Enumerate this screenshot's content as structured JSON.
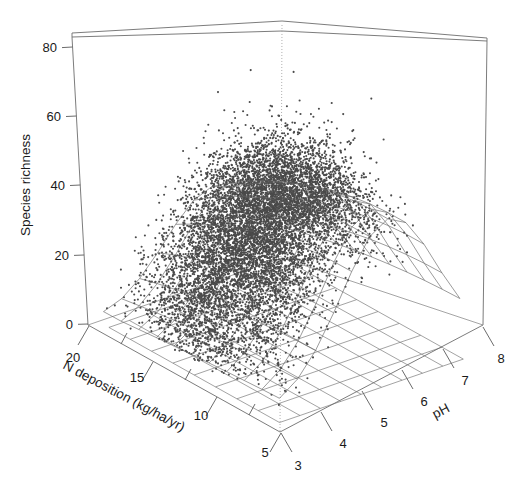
{
  "figure": {
    "type": "3d-scatter-with-surface",
    "background": "#ffffff",
    "point_color": "#4a4a4a",
    "line_color": "#5f5f5f"
  },
  "axes": {
    "z": {
      "name": "Species richness",
      "title": "Species richness",
      "ticks": [
        "0",
        "20",
        "40",
        "60",
        "80"
      ],
      "tick_values": [
        0,
        20,
        40,
        60,
        80
      ],
      "range": [
        -4,
        86
      ],
      "orientation": "vertical-left"
    },
    "x": {
      "name": "N deposition",
      "title": "N deposition (kg/ha/yr)",
      "ticks": [
        "20",
        "15",
        "10",
        "5"
      ],
      "tick_values": [
        20,
        15,
        10,
        5
      ],
      "range": [
        21,
        3
      ],
      "orientation": "bottom-left-receding"
    },
    "y": {
      "name": "pH",
      "title": "pH",
      "ticks": [
        "3",
        "4",
        "5",
        "6",
        "7",
        "8"
      ],
      "tick_values": [
        3,
        4,
        5,
        6,
        7,
        8
      ],
      "range": [
        2.7,
        8.4
      ],
      "orientation": "bottom-right-receding"
    }
  },
  "chart_data": {
    "type": "scatter",
    "title": "",
    "xlabel": "N deposition (kg/ha/yr)",
    "ylabel": "pH",
    "zlabel": "Species richness",
    "x_ticks": [
      20,
      15,
      10,
      5
    ],
    "y_ticks": [
      3,
      4,
      5,
      6,
      7,
      8
    ],
    "z_ticks": [
      0,
      20,
      40,
      60,
      80
    ],
    "xlim": [
      21,
      3
    ],
    "ylim": [
      2.7,
      8.4
    ],
    "zlim": [
      -4,
      86
    ],
    "grid": true,
    "legend": "none",
    "n_points_approx": 9000,
    "point_size_px": 2.1,
    "surface": {
      "description": "fitted response surface mesh over N deposition and pH",
      "peak_species_richness": 48,
      "peak_ph": 6.2,
      "peak_n_deposition": 6,
      "mesh_rows": 11,
      "mesh_cols": 11
    },
    "cloud": {
      "z_median": 20,
      "z_max": 84,
      "z_min": 0,
      "densest_ph": 5.2,
      "densest_n_deposition": 13
    }
  }
}
